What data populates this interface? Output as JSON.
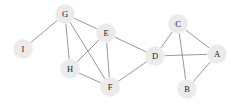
{
  "figure": {
    "kind": "undirected-graph-diagram",
    "background_color": "#ffffff",
    "node_fill_color": "#ebebeb",
    "node_halo_color": "#f2f2f2",
    "node_label_color": "#1a1a1a",
    "edge_color": "#8d8d8d",
    "node_radius": 8.5
  },
  "graph": {
    "node_count": 9,
    "edge_count": 13,
    "nodes": [
      {
        "id": "A",
        "label": "A",
        "x": 217,
        "y": 54,
        "degree": 3
      },
      {
        "id": "B",
        "label": "B",
        "x": 187,
        "y": 89,
        "degree": 2
      },
      {
        "id": "C",
        "label": "C",
        "x": 178,
        "y": 24,
        "degree": 3
      },
      {
        "id": "D",
        "label": "D",
        "x": 155,
        "y": 56,
        "degree": 4
      },
      {
        "id": "E",
        "label": "E",
        "x": 106,
        "y": 33,
        "degree": 4
      },
      {
        "id": "F",
        "label": "F",
        "x": 110,
        "y": 87,
        "degree": 4
      },
      {
        "id": "G",
        "label": "G",
        "x": 65,
        "y": 14,
        "degree": 4
      },
      {
        "id": "H",
        "label": "H",
        "x": 70,
        "y": 69,
        "degree": 3
      },
      {
        "id": "I",
        "label": "I",
        "x": 23,
        "y": 49,
        "degree": 1
      }
    ],
    "edges": [
      {
        "source": "I",
        "target": "G"
      },
      {
        "source": "G",
        "target": "E"
      },
      {
        "source": "G",
        "target": "H"
      },
      {
        "source": "G",
        "target": "F"
      },
      {
        "source": "E",
        "target": "H"
      },
      {
        "source": "E",
        "target": "F"
      },
      {
        "source": "E",
        "target": "D"
      },
      {
        "source": "H",
        "target": "F"
      },
      {
        "source": "F",
        "target": "D"
      },
      {
        "source": "D",
        "target": "C"
      },
      {
        "source": "D",
        "target": "A"
      },
      {
        "source": "C",
        "target": "A"
      },
      {
        "source": "C",
        "target": "B"
      },
      {
        "source": "A",
        "target": "B"
      }
    ]
  }
}
